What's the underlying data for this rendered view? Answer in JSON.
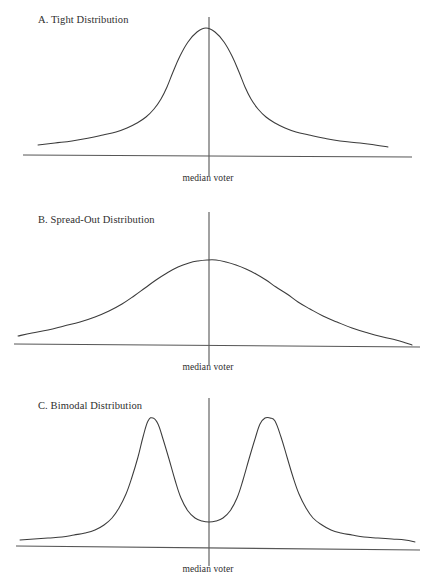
{
  "figure": {
    "background_color": "#ffffff",
    "curve_color": "#3b3b3b",
    "axis_color": "#565656",
    "median_line_color": "#5c5c5c"
  },
  "panels": [
    {
      "id": "a",
      "label": "A. Tight Distribution",
      "label_x": 38,
      "label_y": 22,
      "median_label": "median voter",
      "median_label_x": 208,
      "median_label_y": 182
    },
    {
      "id": "b",
      "label": "B. Spread-Out Distribution",
      "label_x": 38,
      "label_y": 222,
      "median_label": "median voter",
      "median_label_x": 208,
      "median_label_y": 371
    },
    {
      "id": "c",
      "label": "C. Bimodal Distribution",
      "label_x": 38,
      "label_y": 408,
      "median_label": "median voter",
      "median_label_x": 208,
      "median_label_y": 573
    }
  ],
  "chart_data": [
    {
      "type": "line",
      "id": "a",
      "title": "A. Tight Distribution",
      "xlabel": "",
      "ylabel": "",
      "annotations": [
        "median voter"
      ],
      "median_x": 0,
      "axis": {
        "x0": 23,
        "x1": 412,
        "y0": 155,
        "y1": 157
      },
      "median_line": {
        "x": 209,
        "y_top": 17,
        "y_bottom": 176
      },
      "peak": {
        "x": 206,
        "y": 28
      },
      "baseline_y": 148,
      "grid": false,
      "legend": "none",
      "curve_points": [
        [
          38,
          145
        ],
        [
          55,
          143
        ],
        [
          72,
          141
        ],
        [
          89,
          138
        ],
        [
          103,
          135
        ],
        [
          116,
          132
        ],
        [
          127,
          128
        ],
        [
          137,
          123
        ],
        [
          146,
          117
        ],
        [
          154,
          109
        ],
        [
          161,
          99
        ],
        [
          167,
          87
        ],
        [
          173,
          72
        ],
        [
          180,
          56
        ],
        [
          188,
          42
        ],
        [
          197,
          32
        ],
        [
          206,
          28
        ],
        [
          215,
          32
        ],
        [
          224,
          42
        ],
        [
          232,
          56
        ],
        [
          239,
          72
        ],
        [
          245,
          87
        ],
        [
          251,
          99
        ],
        [
          258,
          109
        ],
        [
          266,
          117
        ],
        [
          275,
          123
        ],
        [
          285,
          128
        ],
        [
          296,
          132
        ],
        [
          309,
          135
        ],
        [
          323,
          138
        ],
        [
          340,
          141
        ],
        [
          360,
          143
        ],
        [
          375,
          145
        ],
        [
          388,
          147
        ]
      ]
    },
    {
      "type": "line",
      "id": "b",
      "title": "B. Spread-Out Distribution",
      "xlabel": "",
      "ylabel": "",
      "annotations": [
        "median voter"
      ],
      "median_x": 0,
      "axis": {
        "x0": 14,
        "x1": 420,
        "y0": 344,
        "y1": 347
      },
      "median_line": {
        "x": 209,
        "y_top": 212,
        "y_bottom": 365
      },
      "peak": {
        "x": 207,
        "y": 260
      },
      "baseline_y": 338,
      "grid": false,
      "legend": "none",
      "curve_points": [
        [
          18,
          336
        ],
        [
          32,
          333
        ],
        [
          48,
          330
        ],
        [
          64,
          326
        ],
        [
          80,
          322
        ],
        [
          95,
          317
        ],
        [
          109,
          311
        ],
        [
          122,
          304
        ],
        [
          134,
          296
        ],
        [
          145,
          288
        ],
        [
          156,
          280
        ],
        [
          167,
          273
        ],
        [
          178,
          267
        ],
        [
          189,
          263
        ],
        [
          198,
          261
        ],
        [
          207,
          260
        ],
        [
          216,
          260
        ],
        [
          226,
          262
        ],
        [
          236,
          265
        ],
        [
          246,
          269
        ],
        [
          256,
          274
        ],
        [
          266,
          280
        ],
        [
          276,
          287
        ],
        [
          287,
          294
        ],
        [
          298,
          302
        ],
        [
          310,
          309
        ],
        [
          323,
          316
        ],
        [
          337,
          322
        ],
        [
          352,
          328
        ],
        [
          368,
          333
        ],
        [
          383,
          337
        ],
        [
          396,
          340
        ],
        [
          406,
          343
        ],
        [
          412,
          345
        ]
      ]
    },
    {
      "type": "line",
      "id": "c",
      "title": "C. Bimodal Distribution",
      "xlabel": "",
      "ylabel": "",
      "annotations": [
        "median voter"
      ],
      "median_x": 0,
      "axis": {
        "x0": 16,
        "x1": 420,
        "y0": 546,
        "y1": 550
      },
      "median_line": {
        "x": 209,
        "y_top": 398,
        "y_bottom": 566
      },
      "peaks": [
        {
          "x": 148,
          "y": 418
        },
        {
          "x": 272,
          "y": 418
        }
      ],
      "valley": {
        "x": 209,
        "y": 522
      },
      "baseline_y": 540,
      "grid": false,
      "legend": "none",
      "curve_points": [
        [
          20,
          540
        ],
        [
          34,
          539
        ],
        [
          48,
          538
        ],
        [
          62,
          537
        ],
        [
          74,
          535
        ],
        [
          85,
          533
        ],
        [
          95,
          530
        ],
        [
          104,
          525
        ],
        [
          112,
          518
        ],
        [
          119,
          508
        ],
        [
          126,
          494
        ],
        [
          132,
          477
        ],
        [
          138,
          457
        ],
        [
          143,
          437
        ],
        [
          148,
          421
        ],
        [
          153,
          418
        ],
        [
          158,
          424
        ],
        [
          163,
          439
        ],
        [
          169,
          459
        ],
        [
          175,
          480
        ],
        [
          181,
          498
        ],
        [
          188,
          511
        ],
        [
          195,
          518
        ],
        [
          202,
          521
        ],
        [
          209,
          522
        ],
        [
          216,
          521
        ],
        [
          223,
          518
        ],
        [
          230,
          511
        ],
        [
          237,
          498
        ],
        [
          243,
          480
        ],
        [
          249,
          459
        ],
        [
          255,
          439
        ],
        [
          260,
          424
        ],
        [
          265,
          418
        ],
        [
          270,
          418
        ],
        [
          275,
          421
        ],
        [
          281,
          437
        ],
        [
          287,
          457
        ],
        [
          293,
          477
        ],
        [
          299,
          494
        ],
        [
          306,
          508
        ],
        [
          313,
          518
        ],
        [
          322,
          525
        ],
        [
          331,
          530
        ],
        [
          341,
          533
        ],
        [
          352,
          535
        ],
        [
          364,
          537
        ],
        [
          378,
          538
        ],
        [
          392,
          539
        ],
        [
          405,
          540
        ],
        [
          415,
          542
        ]
      ]
    }
  ]
}
